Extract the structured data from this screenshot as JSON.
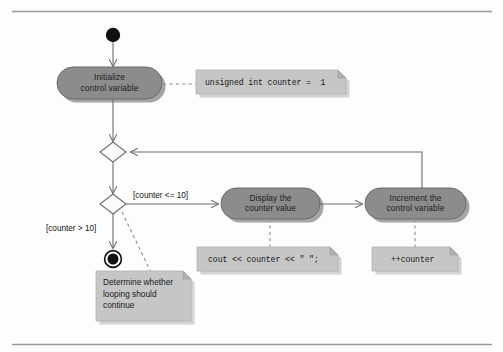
{
  "figure": {
    "kind": "uml-activity-diagram",
    "background_color": "#fdfdfd",
    "rules": {
      "top_label": "top rule",
      "bottom_label": "bottom rule",
      "color": "#9a9a9a"
    }
  },
  "palette": {
    "activity_fill": "#8c8c8c",
    "activity_stroke": "#6a6a6a",
    "note_fill": "#c6c6c6",
    "note_fold": "#b0b0b0",
    "line": "#6d6d6d",
    "dash": "#8d8d8d",
    "terminal": "#111111",
    "text": "#1c1c1c"
  },
  "nodes": {
    "initial": {
      "name": "initial-node",
      "label": "Initial node"
    },
    "final": {
      "name": "final-node",
      "label": "Final node"
    },
    "merge": {
      "name": "merge-diamond",
      "label": "Merge"
    },
    "decision": {
      "name": "decision-diamond",
      "label": "Decision"
    }
  },
  "activities": [
    {
      "id": "initialize",
      "line1": "Initialize",
      "line2": "control variable",
      "text": "Initialize\ncontrol variable"
    },
    {
      "id": "display",
      "line1": "Display the",
      "line2": "counter value",
      "text": "Display the\ncounter value"
    },
    {
      "id": "increment",
      "line1": "Increment the",
      "line2": "control variable",
      "text": "Increment the\ncontrol variable"
    }
  ],
  "notes": [
    {
      "id": "note-init",
      "kind": "code",
      "text": "unsigned int counter =  1",
      "attached_to": "initialize"
    },
    {
      "id": "note-display",
      "kind": "code",
      "text": "cout << counter << \" \";",
      "attached_to": "display"
    },
    {
      "id": "note-increment",
      "kind": "code",
      "text": "++counter",
      "attached_to": "increment"
    },
    {
      "id": "note-decision",
      "kind": "prose",
      "text": "Determine whether\nlooping should\ncontinue",
      "attached_to": "decision"
    }
  ],
  "guards": [
    {
      "id": "guard-true",
      "text": "[counter <= 10]"
    },
    {
      "id": "guard-false",
      "text": "[counter > 10]"
    }
  ]
}
